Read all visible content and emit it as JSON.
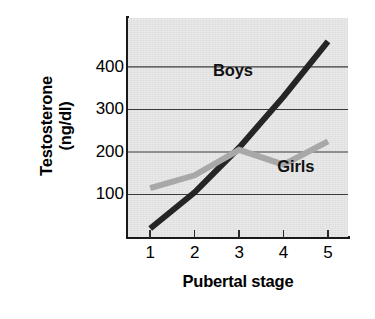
{
  "chart_data": {
    "type": "line",
    "title": "",
    "xlabel": "Pubertal stage",
    "ylabel": "Testosterone (ng/dl)",
    "ylabel_line1": "Testosterone",
    "ylabel_line2": "(ng/dl)",
    "categories": [
      "1",
      "2",
      "3",
      "4",
      "5"
    ],
    "x": [
      1,
      2,
      3,
      4,
      5
    ],
    "xlim": [
      0.5,
      5.45
    ],
    "ylim": [
      0,
      515
    ],
    "yticks": [
      100,
      200,
      300,
      400
    ],
    "ytick_labels": [
      "100",
      "200",
      "300",
      "400"
    ],
    "xticks": [
      1,
      2,
      3,
      4,
      5
    ],
    "xtick_labels": [
      "1",
      "2",
      "3",
      "4",
      "5"
    ],
    "grid": "horizontal",
    "legend_position": "inline-annotations",
    "plot_background": "#e9e9e9",
    "series": [
      {
        "name": "Boys",
        "label": "Boys",
        "color": "#252525",
        "linewidth": 6,
        "values": [
          20,
          105,
          210,
          330,
          460
        ]
      },
      {
        "name": "Girls",
        "label": "Girls",
        "color": "#a8a8a8",
        "linewidth": 6,
        "values": [
          115,
          145,
          205,
          170,
          225
        ]
      }
    ],
    "annotations": [
      {
        "text": "Boys",
        "series": "Boys",
        "x": 2.95,
        "y": 390
      },
      {
        "text": "Girls",
        "series": "Girls",
        "x": 4.4,
        "y": 165
      }
    ]
  },
  "axis": {
    "y_title_line1": "Testosterone",
    "y_title_line2": "(ng/dl)",
    "x_title": "Pubertal stage"
  }
}
